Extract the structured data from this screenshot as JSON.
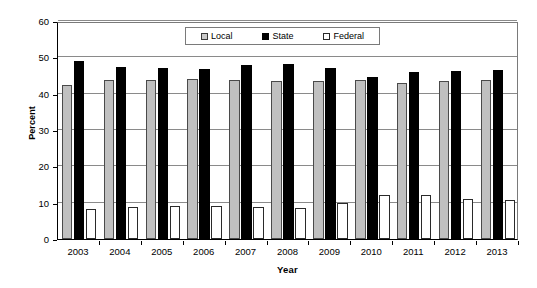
{
  "chart_data": {
    "type": "bar",
    "title": "",
    "xlabel": "Year",
    "ylabel": "Percent",
    "categories": [
      "2003",
      "2004",
      "2005",
      "2006",
      "2007",
      "2008",
      "2009",
      "2010",
      "2011",
      "2012",
      "2013"
    ],
    "series": [
      {
        "name": "Local",
        "color": "#c0c0c0",
        "values": [
          42.3,
          43.7,
          43.7,
          44.1,
          43.8,
          43.6,
          43.4,
          43.7,
          43.0,
          43.4,
          43.8
        ]
      },
      {
        "name": "State",
        "color": "#000000",
        "values": [
          48.9,
          47.4,
          47.2,
          46.9,
          47.8,
          48.3,
          47.1,
          44.7,
          45.9,
          46.3,
          46.4
        ]
      },
      {
        "name": "Federal",
        "color": "#ffffff",
        "values": [
          8.3,
          8.9,
          9.0,
          9.1,
          8.8,
          8.6,
          10.0,
          12.1,
          12.1,
          11.0,
          10.8
        ]
      }
    ],
    "ylim": [
      0,
      60
    ],
    "yticks": [
      "0",
      "10",
      "20",
      "30",
      "40",
      "50",
      "60"
    ],
    "grid": true,
    "legend_position": "top-center",
    "legend_entries": [
      "Local",
      "State",
      "Federal"
    ]
  }
}
